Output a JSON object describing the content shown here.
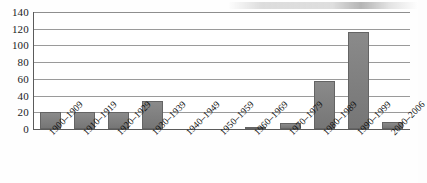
{
  "chart_data": {
    "type": "bar",
    "title": "",
    "xlabel": "",
    "ylabel": "",
    "ylim": [
      0,
      140
    ],
    "grid": true,
    "legend": "none",
    "yticks": [
      0,
      20,
      40,
      60,
      80,
      100,
      120,
      140
    ],
    "categories": [
      "1900–1909",
      "1910–1919",
      "1920–1929",
      "1930–1939",
      "1940–1949",
      "1950–1959",
      "1960–1969",
      "1970–1979",
      "1980–1989",
      "1990–1999",
      "2000–2006"
    ],
    "values": [
      20,
      20,
      20,
      33,
      0,
      0,
      1,
      7,
      58,
      116,
      8
    ],
    "series": [
      {
        "name": "Count",
        "values": [
          20,
          20,
          20,
          33,
          0,
          0,
          1,
          7,
          58,
          116,
          8
        ]
      }
    ],
    "colors": {
      "bar_fill": "#7d7d7d",
      "bar_border": "#646464",
      "gridline": "#9a9a9a",
      "axis": "#5b5b5b",
      "plot_background": "#ffffff",
      "figure_background": "#fefefe",
      "text": "#121212"
    }
  }
}
